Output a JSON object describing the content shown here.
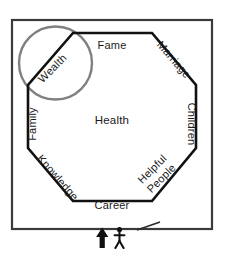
{
  "diagram": {
    "type": "feng-shui-bagua-octagon",
    "center_label": "Health",
    "areas": [
      {
        "id": "wealth",
        "label": "Wealth",
        "position": "top-left-diagonal",
        "rotation": -45,
        "highlighted": true
      },
      {
        "id": "fame",
        "label": "Fame",
        "position": "top",
        "rotation": 0,
        "highlighted": false
      },
      {
        "id": "marriage",
        "label": "Marriage",
        "position": "top-right-diagonal",
        "rotation": 45,
        "highlighted": false
      },
      {
        "id": "children",
        "label": "Children",
        "position": "right",
        "rotation": 90,
        "highlighted": false
      },
      {
        "id": "helpful-people",
        "label": "Helpful People",
        "position": "bottom-right-diagonal",
        "rotation": -45,
        "highlighted": false
      },
      {
        "id": "career",
        "label": "Career",
        "position": "bottom",
        "rotation": 0,
        "highlighted": false
      },
      {
        "id": "knowledge",
        "label": "Knowledge",
        "position": "bottom-left-diagonal",
        "rotation": 45,
        "highlighted": false
      },
      {
        "id": "family",
        "label": "Family",
        "position": "left",
        "rotation": -90,
        "highlighted": false
      }
    ],
    "helpful_people_lines": [
      "Helpful",
      "People"
    ],
    "entrance": {
      "arrow_icon": "up-arrow-icon",
      "person_icon": "stick-figure-person-icon",
      "pointer_icon": "pointer-line-icon"
    },
    "colors": {
      "outline": "#1a1a1a",
      "outer_frame": "#3a3a3a",
      "highlight_circle": "#808080",
      "label_text": "#1a1a1a",
      "background": "#ffffff"
    }
  }
}
